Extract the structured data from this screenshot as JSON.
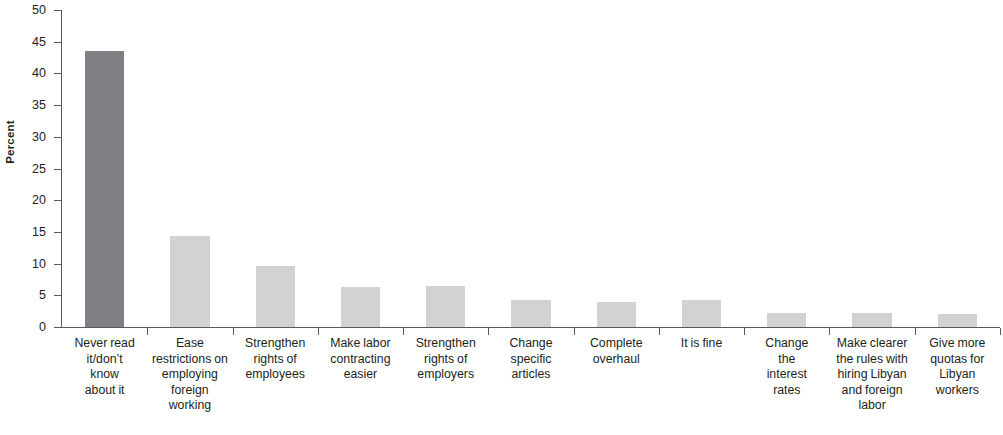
{
  "chart_data": {
    "type": "bar",
    "title": "",
    "subtitle": "",
    "xlabel": "",
    "ylabel": "Percent",
    "ylim": [
      0,
      50
    ],
    "yticks": [
      0,
      5,
      10,
      15,
      20,
      25,
      30,
      35,
      40,
      45,
      50
    ],
    "grid": false,
    "legend": null,
    "categories": [
      "Never read it/don’t know about it",
      "Ease restrictions on employing foreign working",
      "Strengthen rights of employees",
      "Make labor contracting easier",
      "Strengthen rights of employers",
      "Change specific articles",
      "Complete overhaul",
      "It is fine",
      "Change the interest rates",
      "Make clearer the rules with hiring Libyan and foreign labor",
      "Give more quotas for Libyan workers"
    ],
    "values": [
      43.6,
      14.4,
      9.7,
      6.3,
      6.4,
      4.2,
      4.0,
      4.2,
      2.2,
      2.2,
      2.1
    ],
    "bar_colors": [
      "#7f8083",
      "#d2d2d2",
      "#d2d2d2",
      "#d2d2d2",
      "#d2d2d2",
      "#d2d2d2",
      "#d2d2d2",
      "#d2d2d2",
      "#d2d2d2",
      "#d2d2d2",
      "#d2d2d2"
    ],
    "axis_color": "#58595b"
  },
  "axis": {
    "y_title": "Percent",
    "tick_labels": [
      "0",
      "5",
      "10",
      "15",
      "20",
      "25",
      "30",
      "35",
      "40",
      "45",
      "50"
    ]
  },
  "categories_display": [
    "Never read\nit/don’t\nknow\nabout it",
    "Ease\nrestrictions on\nemploying\nforeign\nworking",
    "Strengthen\nrights of\nemployees",
    "Make labor\ncontracting\neasier",
    "Strengthen\nrights of\nemployers",
    "Change\nspecific\narticles",
    "Complete\noverhaul",
    "It is fine",
    "Change\nthe\ninterest\nrates",
    "Make clearer\nthe rules with\nhiring Libyan\nand foreign\nlabor",
    "Give more\nquotas for\nLibyan\nworkers"
  ]
}
